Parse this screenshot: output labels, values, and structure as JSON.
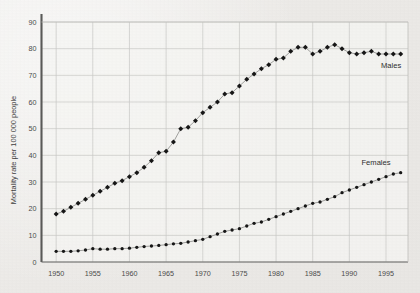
{
  "chart_data": {
    "type": "line",
    "title": "",
    "xlabel": "",
    "ylabel": "Mortality rate per 100 000 people",
    "xlim": [
      1948,
      1998
    ],
    "ylim": [
      0,
      90
    ],
    "grid": true,
    "legend_position": "inline-right",
    "x_ticks": [
      "1950",
      "1955",
      "1960",
      "1965",
      "1970",
      "1975",
      "1980",
      "1985",
      "1990",
      "1995"
    ],
    "y_ticks": [
      "0",
      "10",
      "20",
      "30",
      "40",
      "50",
      "60",
      "70",
      "80",
      "90"
    ],
    "x": [
      1950,
      1951,
      1952,
      1953,
      1954,
      1955,
      1956,
      1957,
      1958,
      1959,
      1960,
      1961,
      1962,
      1963,
      1964,
      1965,
      1966,
      1967,
      1968,
      1969,
      1970,
      1971,
      1972,
      1973,
      1974,
      1975,
      1976,
      1977,
      1978,
      1979,
      1980,
      1981,
      1982,
      1983,
      1984,
      1985,
      1986,
      1987,
      1988,
      1989,
      1990,
      1991,
      1992,
      1993,
      1994,
      1995,
      1996,
      1997
    ],
    "series": [
      {
        "name": "Males",
        "marker": "diamond",
        "color": "#161616",
        "values": [
          18,
          19,
          20.5,
          22,
          23.5,
          25,
          26.5,
          28,
          29.5,
          30.5,
          32,
          33.5,
          35.5,
          38,
          41,
          41.5,
          45,
          50,
          50.5,
          53,
          56,
          58,
          60,
          63,
          63.5,
          66,
          68.5,
          70.5,
          72.5,
          74,
          76,
          76.5,
          79,
          80.5,
          80.5,
          78,
          79,
          80.5,
          81.5,
          80,
          78.5,
          78,
          78.5,
          79,
          78,
          78,
          78,
          78
        ]
      },
      {
        "name": "Females",
        "marker": "dot",
        "color": "#161616",
        "values": [
          4,
          4,
          4,
          4.2,
          4.5,
          5,
          4.8,
          4.8,
          5,
          5,
          5.2,
          5.5,
          5.8,
          6,
          6.2,
          6.5,
          6.8,
          7,
          7.5,
          8,
          8.5,
          9.5,
          10.5,
          11.5,
          12,
          12.5,
          13.5,
          14.5,
          15,
          16,
          17,
          18,
          19,
          20,
          21,
          22,
          22.5,
          23.5,
          24.5,
          26,
          27,
          28,
          29,
          30,
          31,
          32,
          33,
          33.5
        ]
      }
    ]
  },
  "axis": {
    "y_title": "Mortality rate per 100 000 people"
  },
  "labels": {
    "males": "Males",
    "females": "Females"
  }
}
